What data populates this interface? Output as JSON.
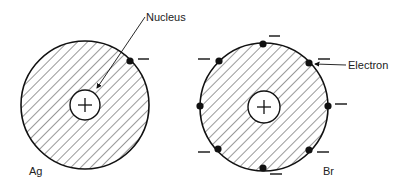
{
  "figure": {
    "colors": {
      "line": "#111111",
      "hatch": "#333333",
      "background": "#ffffff"
    }
  },
  "atoms": [
    {
      "symbol": "Ag",
      "center": [
        85,
        105
      ],
      "radius": 64,
      "nucleus_radius": 15,
      "nucleus_charge": "+",
      "valence_electrons": 1,
      "electrons": [
        {
          "x": 130,
          "y": 61,
          "charge": "−",
          "mark": [
            143,
            59
          ]
        }
      ]
    },
    {
      "symbol": "Br",
      "center": [
        264,
        107
      ],
      "radius": 64,
      "nucleus_radius": 16,
      "nucleus_charge": "+",
      "valence_electrons": 8,
      "electrons": [
        {
          "x": 263,
          "y": 44,
          "charge": "−",
          "mark": [
            275,
            36
          ]
        },
        {
          "x": 309,
          "y": 63,
          "charge": "−",
          "mark": [
            324,
            59
          ]
        },
        {
          "x": 328,
          "y": 106,
          "charge": "−",
          "mark": [
            341,
            104
          ]
        },
        {
          "x": 309,
          "y": 150,
          "charge": "−",
          "mark": [
            323,
            152
          ]
        },
        {
          "x": 263,
          "y": 168,
          "charge": "−",
          "mark": [
            276,
            174
          ]
        },
        {
          "x": 218,
          "y": 149,
          "charge": "−",
          "mark": [
            204,
            152
          ]
        },
        {
          "x": 200,
          "y": 106,
          "charge": "",
          "mark": null
        },
        {
          "x": 219,
          "y": 61,
          "charge": "−",
          "mark": [
            204,
            59
          ]
        }
      ]
    }
  ],
  "labels": {
    "nucleus": "Nucleus",
    "electron": "Electron",
    "ag": "Ag",
    "br": "Br"
  },
  "annotations": [
    {
      "text": "Nucleus",
      "arrow_from": [
        145,
        17
      ],
      "arrow_to": [
        96,
        89
      ]
    },
    {
      "text": "Electron",
      "arrow_from": [
        346,
        65
      ],
      "arrow_to": [
        315,
        63
      ]
    }
  ]
}
